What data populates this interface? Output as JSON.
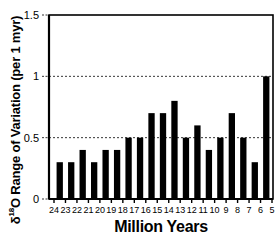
{
  "chart_data": {
    "type": "bar",
    "title": "",
    "xlabel": "Million Years",
    "ylabel": "δ18O Range of Variation (per 1 myr)",
    "ylabel_parts": {
      "delta": "δ",
      "sup": "18",
      "rest": "O  Range of Variation (per 1 myr)"
    },
    "ylim": [
      0,
      1.5
    ],
    "yticks": [
      0,
      0.5,
      1,
      1.5
    ],
    "ytick_labels": [
      "0",
      "0.5",
      "1",
      "1.5"
    ],
    "gridlines": {
      "dotted_at": [
        0.5,
        1
      ],
      "style": "dotted"
    },
    "xtick_labels": [
      "24",
      "23",
      "22",
      "21",
      "20",
      "19",
      "18",
      "17",
      "16",
      "15",
      "14",
      "13",
      "12",
      "11",
      "10",
      "9",
      "8",
      "7",
      "6",
      "5"
    ],
    "categories": [
      "24-23",
      "23-22",
      "22-21",
      "21-20",
      "20-19",
      "19-18",
      "18-17",
      "17-16",
      "16-15",
      "15-14",
      "14-13",
      "13-12",
      "12-11",
      "11-10",
      "10-9",
      "9-8",
      "8-7",
      "7-6",
      "6-5"
    ],
    "values": [
      0.3,
      0.3,
      0.4,
      0.3,
      0.4,
      0.4,
      0.5,
      0.5,
      0.7,
      0.7,
      0.8,
      0.5,
      0.6,
      0.4,
      0.5,
      0.7,
      0.5,
      0.3,
      1.0
    ],
    "bar_color": "#000000",
    "legend": null
  }
}
